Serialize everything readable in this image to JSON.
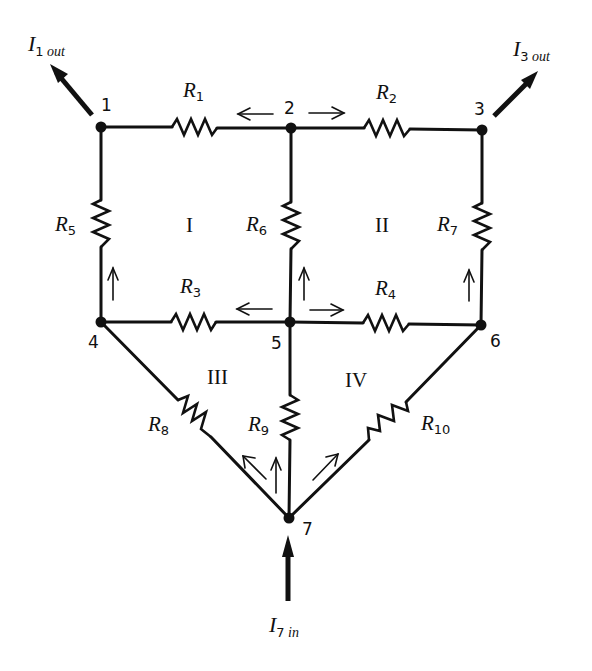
{
  "diagram": {
    "type": "resistor network",
    "nodes": [
      {
        "id": "1",
        "label": "1",
        "x": 101,
        "y": 127
      },
      {
        "id": "2",
        "label": "2",
        "x": 291,
        "y": 128
      },
      {
        "id": "3",
        "label": "3",
        "x": 482,
        "y": 130
      },
      {
        "id": "4",
        "label": "4",
        "x": 101,
        "y": 322
      },
      {
        "id": "5",
        "label": "5",
        "x": 290,
        "y": 322
      },
      {
        "id": "6",
        "label": "6",
        "x": 481,
        "y": 325
      },
      {
        "id": "7",
        "label": "7",
        "x": 289,
        "y": 518
      }
    ],
    "resistors": [
      {
        "name": "R",
        "sub": "1",
        "from": "1",
        "to": "2"
      },
      {
        "name": "R",
        "sub": "2",
        "from": "2",
        "to": "3"
      },
      {
        "name": "R",
        "sub": "3",
        "from": "4",
        "to": "5"
      },
      {
        "name": "R",
        "sub": "4",
        "from": "5",
        "to": "6"
      },
      {
        "name": "R",
        "sub": "5",
        "from": "1",
        "to": "4"
      },
      {
        "name": "R",
        "sub": "6",
        "from": "2",
        "to": "5"
      },
      {
        "name": "R",
        "sub": "7",
        "from": "3",
        "to": "6"
      },
      {
        "name": "R",
        "sub": "8",
        "from": "4",
        "to": "7"
      },
      {
        "name": "R",
        "sub": "9",
        "from": "5",
        "to": "7"
      },
      {
        "name": "R",
        "sub": "10",
        "from": "6",
        "to": "7"
      }
    ],
    "loops": [
      "I",
      "II",
      "III",
      "IV"
    ],
    "currents": {
      "i1": {
        "symbol": "I",
        "sub_num": "1",
        "sub_text": "out"
      },
      "i3": {
        "symbol": "I",
        "sub_num": "3",
        "sub_text": "out"
      },
      "i7": {
        "symbol": "I",
        "sub_num": "7",
        "sub_text": "in"
      }
    },
    "branch_arrows": [
      {
        "branch": "R1",
        "direction": "toward node 1"
      },
      {
        "branch": "R2",
        "direction": "toward node 3"
      },
      {
        "branch": "R3",
        "direction": "toward node 4"
      },
      {
        "branch": "R4",
        "direction": "toward node 6"
      },
      {
        "branch": "R5",
        "direction": "up, toward node 1"
      },
      {
        "branch": "R6",
        "direction": "up, toward node 2"
      },
      {
        "branch": "R7",
        "direction": "up, toward node 3"
      },
      {
        "branch": "R8",
        "direction": "toward node 4"
      },
      {
        "branch": "R9",
        "direction": "up, toward node 5"
      },
      {
        "branch": "R10",
        "direction": "toward node 6"
      }
    ],
    "colors": {
      "ink": "#111111",
      "background": "#ffffff"
    }
  }
}
